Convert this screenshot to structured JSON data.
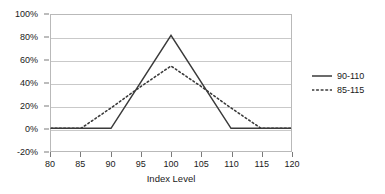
{
  "chart_data": {
    "type": "line",
    "title": "",
    "xlabel": "Index Level",
    "ylabel": "",
    "xlim": [
      80,
      120
    ],
    "ylim": [
      -20,
      100
    ],
    "grid": true,
    "legend_position": "right",
    "x_ticks": [
      80,
      85,
      90,
      95,
      100,
      105,
      110,
      115,
      120
    ],
    "x_tick_labels": [
      "80",
      "85",
      "90",
      "95",
      "100",
      "105",
      "110",
      "115",
      "120"
    ],
    "y_ticks": [
      -20,
      0,
      20,
      40,
      60,
      80,
      100
    ],
    "y_tick_labels": [
      "-20%",
      "0%",
      "20%",
      "40%",
      "60%",
      "80%",
      "100%"
    ],
    "series": [
      {
        "name": "90-110",
        "style": "solid",
        "color": "#3a3a3a",
        "x": [
          80,
          85,
          90,
          95,
          100,
          105,
          110,
          115,
          120
        ],
        "values": [
          0,
          0,
          0,
          41,
          82,
          41,
          0,
          0,
          0
        ]
      },
      {
        "name": "85-115",
        "style": "dotted",
        "color": "#3a3a3a",
        "x": [
          80,
          85,
          90,
          95,
          100,
          105,
          110,
          115,
          120
        ],
        "values": [
          0,
          0,
          18,
          37,
          55,
          37,
          18,
          0,
          0
        ]
      }
    ]
  },
  "legend": {
    "items": [
      {
        "label": "90-110"
      },
      {
        "label": "85-115"
      }
    ]
  },
  "axes": {
    "x_title": "Index Level"
  },
  "colors": {
    "series_line": "#3a3a3a",
    "gridline": "#c9c9c9",
    "frame": "#b9b9b9",
    "text": "#1a1a1a",
    "background": "#ffffff"
  }
}
